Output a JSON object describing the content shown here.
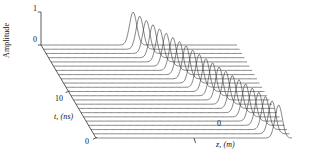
{
  "figure": {
    "kind": "3d-waterfall-plot",
    "background": "#ffffff",
    "line_color": "#3c3c3c",
    "axis_color": "#333333"
  },
  "axes": {
    "amplitude": {
      "label": "Amplitude",
      "ticks": [
        "1",
        "0"
      ],
      "tick_values": [
        1,
        0
      ],
      "range": [
        0,
        1
      ]
    },
    "time": {
      "label": "t, (ns)",
      "ticks": [
        "10",
        "0"
      ],
      "tick_values": [
        10,
        0
      ],
      "range": [
        0,
        20
      ],
      "unit": "ns"
    },
    "space": {
      "label": "z, (m)",
      "ticks": [
        "0"
      ],
      "tick_values": [
        0
      ],
      "unit": "m"
    }
  },
  "chart_data": {
    "type": "line",
    "title": "",
    "xlabel": "z, (m)",
    "ylabel": "Amplitude",
    "zlabel": "t, (ns)",
    "grid": false,
    "legend": false,
    "projection": "oblique-3d-waterfall",
    "series_count": 23,
    "x": [
      -1.0,
      -0.95,
      -0.9,
      -0.85,
      -0.8,
      -0.75,
      -0.7,
      -0.65,
      -0.6,
      -0.55,
      -0.5,
      -0.45,
      -0.4,
      -0.35,
      -0.3,
      -0.25,
      -0.2,
      -0.15,
      -0.1,
      -0.05,
      0.0,
      0.05,
      0.1,
      0.15,
      0.2,
      0.25,
      0.3,
      0.35,
      0.4,
      0.45,
      0.5,
      0.55,
      0.6,
      0.65,
      0.7,
      0.75,
      0.8,
      0.85,
      0.9,
      0.95,
      1.0
    ],
    "ylim": [
      0,
      1
    ],
    "xlim": [
      -1,
      1
    ],
    "pulse_shape": "gaussian",
    "pulse_width": 0.052,
    "pulse_peak_amplitude": 1.0,
    "series": [
      {
        "name": "t = 0.0 ns",
        "t": 0.0,
        "peak_z": -0.06,
        "peak_amplitude": 1.0
      },
      {
        "name": "t = 0.9 ns",
        "t": 0.9,
        "peak_z": -0.018,
        "peak_amplitude": 1.0
      },
      {
        "name": "t = 1.8 ns",
        "t": 1.8,
        "peak_z": 0.024,
        "peak_amplitude": 1.0
      },
      {
        "name": "t = 2.7 ns",
        "t": 2.7,
        "peak_z": 0.066,
        "peak_amplitude": 1.0
      },
      {
        "name": "t = 3.6 ns",
        "t": 3.6,
        "peak_z": 0.108,
        "peak_amplitude": 1.0
      },
      {
        "name": "t = 4.5 ns",
        "t": 4.5,
        "peak_z": 0.15,
        "peak_amplitude": 1.0
      },
      {
        "name": "t = 5.5 ns",
        "t": 5.5,
        "peak_z": 0.192,
        "peak_amplitude": 1.0
      },
      {
        "name": "t = 6.4 ns",
        "t": 6.4,
        "peak_z": 0.234,
        "peak_amplitude": 1.0
      },
      {
        "name": "t = 7.3 ns",
        "t": 7.3,
        "peak_z": 0.276,
        "peak_amplitude": 1.0
      },
      {
        "name": "t = 8.2 ns",
        "t": 8.2,
        "peak_z": 0.318,
        "peak_amplitude": 1.0
      },
      {
        "name": "t = 9.1 ns",
        "t": 9.1,
        "peak_z": 0.36,
        "peak_amplitude": 1.0
      },
      {
        "name": "t = 10.0 ns",
        "t": 10.0,
        "peak_z": 0.402,
        "peak_amplitude": 1.0
      },
      {
        "name": "t = 10.9 ns",
        "t": 10.9,
        "peak_z": 0.444,
        "peak_amplitude": 1.0
      },
      {
        "name": "t = 11.8 ns",
        "t": 11.8,
        "peak_z": 0.486,
        "peak_amplitude": 1.0
      },
      {
        "name": "t = 12.7 ns",
        "t": 12.7,
        "peak_z": 0.528,
        "peak_amplitude": 1.0
      },
      {
        "name": "t = 13.6 ns",
        "t": 13.6,
        "peak_z": 0.57,
        "peak_amplitude": 1.0
      },
      {
        "name": "t = 14.5 ns",
        "t": 14.5,
        "peak_z": 0.612,
        "peak_amplitude": 1.0
      },
      {
        "name": "t = 15.5 ns",
        "t": 15.5,
        "peak_z": 0.654,
        "peak_amplitude": 1.0
      },
      {
        "name": "t = 16.4 ns",
        "t": 16.4,
        "peak_z": 0.696,
        "peak_amplitude": 1.0
      },
      {
        "name": "t = 17.3 ns",
        "t": 17.3,
        "peak_z": 0.738,
        "peak_amplitude": 1.0
      },
      {
        "name": "t = 18.2 ns",
        "t": 18.2,
        "peak_z": 0.78,
        "peak_amplitude": 1.0
      },
      {
        "name": "t = 19.1 ns",
        "t": 19.1,
        "peak_z": 0.822,
        "peak_amplitude": 1.0
      },
      {
        "name": "t = 20.0 ns",
        "t": 20.0,
        "peak_z": 0.864,
        "peak_amplitude": 1.0
      }
    ]
  }
}
